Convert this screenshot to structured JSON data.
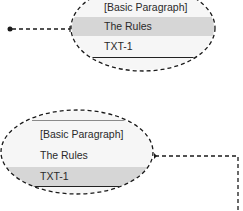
{
  "top_callout": {
    "rows": [
      {
        "label": "[Basic Paragraph]",
        "highlighted": false
      },
      {
        "label": "The Rules",
        "highlighted": true
      },
      {
        "label": "TXT-1",
        "highlighted": false
      }
    ]
  },
  "bottom_callout": {
    "rows": [
      {
        "label": "[Basic Paragraph]",
        "highlighted": false
      },
      {
        "label": "The Rules",
        "highlighted": false
      },
      {
        "label": "TXT-1",
        "highlighted": true
      }
    ]
  },
  "colors": {
    "highlight_row": "#d6d6d6",
    "panel_bg": "#f6f6f6",
    "dash_stroke": "#1a1a1a"
  }
}
